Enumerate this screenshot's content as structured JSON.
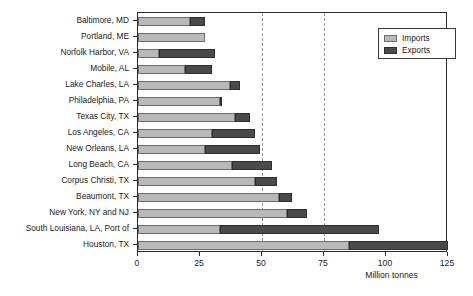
{
  "chart_data": {
    "type": "bar",
    "orientation": "horizontal",
    "stacked": true,
    "title": "",
    "xlabel": "Million tonnes",
    "ylabel": "",
    "xlim": [
      0,
      125
    ],
    "xticks": [
      0,
      25,
      50,
      75,
      100,
      125
    ],
    "xticklabels": [
      "0",
      "25",
      "50",
      "75",
      "100",
      "125"
    ],
    "grid": "vertical dashed at 50 and 75",
    "gridlines": [
      50,
      75
    ],
    "legend": {
      "position": "top-right inside",
      "entries": [
        {
          "label": "Imports",
          "color": "#b9b9b9"
        },
        {
          "label": "Exports",
          "color": "#4a4a4a"
        }
      ]
    },
    "categories": [
      "Baltimore, MD",
      "Portland, ME",
      "Norfolk Harbor, VA",
      "Mobile, AL",
      "Lake Charles, LA",
      "Philadelphia, PA",
      "Texas City, TX",
      "Los Angeles, CA",
      "New Orleans, LA",
      "Long Beach, CA",
      "Corpus Christi, TX",
      "Beaumont, TX",
      "New York, NY and NJ",
      "South Louisiana, LA, Port of",
      "Houston, TX"
    ],
    "series": [
      {
        "name": "Imports",
        "color": "#b9b9b9",
        "values": [
          21,
          27,
          8.5,
          19,
          37,
          33,
          39,
          30,
          27,
          38,
          47,
          57,
          60,
          33,
          85
        ]
      },
      {
        "name": "Exports",
        "color": "#4a4a4a",
        "values": [
          6,
          0,
          22.5,
          11,
          4,
          1,
          6,
          17,
          22,
          16,
          9,
          5,
          8,
          64,
          40
        ]
      }
    ],
    "totals": [
      27,
      27,
      31,
      30,
      41,
      34,
      45,
      47,
      49,
      54,
      56,
      62,
      68,
      97,
      125
    ]
  }
}
